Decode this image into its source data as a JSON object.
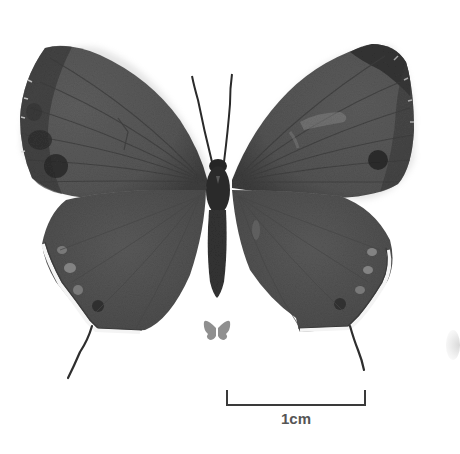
{
  "image": {
    "subject": "butterfly specimen, dorsal view",
    "palette": {
      "background": "#ffffff",
      "wing_base": "#5a5a5a",
      "wing_dark": "#3c3c3c",
      "body": "#2a2a2a",
      "fringe": "#f4f4f4",
      "silhouette": "#8a8a8a"
    }
  },
  "scale": {
    "label": "1cm"
  },
  "icons": {
    "actual_size": "butterfly-silhouette-icon"
  }
}
